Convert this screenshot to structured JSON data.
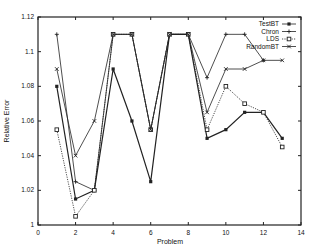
{
  "chart_data": {
    "type": "line",
    "title": "",
    "xlabel": "Problem",
    "ylabel": "Relative Error",
    "xlim": [
      0,
      14
    ],
    "ylim": [
      1,
      1.12
    ],
    "xticks": [
      0,
      2,
      4,
      6,
      8,
      10,
      12,
      14
    ],
    "yticks": [
      1,
      1.02,
      1.04,
      1.06,
      1.08,
      1.1,
      1.12
    ],
    "xtick_labels": [
      "0",
      "2",
      "4",
      "6",
      "8",
      "10",
      "12",
      "14"
    ],
    "ytick_labels": [
      "1",
      "1.02",
      "1.04",
      "1.06",
      "1.08",
      "1.1",
      "1.12"
    ],
    "grid": false,
    "legend_position": "top-right-inside",
    "series": [
      {
        "name": "TestBT",
        "marker": "filled-circle",
        "dash": "solid",
        "x": [
          1,
          2,
          3,
          4,
          5,
          6,
          7,
          8,
          9,
          10,
          11,
          12,
          13
        ],
        "values": [
          1.08,
          1.015,
          1.02,
          1.09,
          1.06,
          1.025,
          1.11,
          1.11,
          1.05,
          1.055,
          1.065,
          1.065,
          1.05
        ]
      },
      {
        "name": "Chron",
        "marker": "plus",
        "dash": "solid",
        "x": [
          1,
          2,
          3,
          4,
          5,
          6,
          7,
          8,
          9,
          10,
          11,
          12
        ],
        "values": [
          1.11,
          1.025,
          1.02,
          1.11,
          1.11,
          1.055,
          1.11,
          1.11,
          1.085,
          1.11,
          1.11,
          1.095
        ]
      },
      {
        "name": "LDS",
        "marker": "square",
        "dash": "dotted",
        "x": [
          1,
          2,
          3,
          4,
          5,
          6,
          7,
          8,
          9,
          10,
          11,
          12,
          13
        ],
        "values": [
          1.055,
          1.005,
          1.02,
          1.11,
          1.11,
          1.055,
          1.11,
          1.11,
          1.055,
          1.08,
          1.07,
          1.065,
          1.045
        ]
      },
      {
        "name": "RandomBT",
        "marker": "cross",
        "dash": "solid",
        "x": [
          1,
          2,
          3,
          4,
          5,
          6,
          7,
          8,
          9,
          10,
          11,
          12,
          13
        ],
        "values": [
          1.09,
          1.04,
          1.06,
          1.11,
          1.11,
          1.055,
          1.11,
          1.11,
          1.065,
          1.09,
          1.09,
          1.095,
          1.095
        ]
      }
    ]
  },
  "layout": {
    "plot": {
      "left": 38,
      "right": 301,
      "top": 17,
      "bottom": 225
    },
    "line_color": "#222222"
  }
}
